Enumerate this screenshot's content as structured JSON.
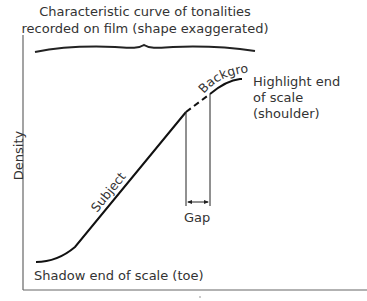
{
  "title": {
    "line1": "Characteristic curve of tonalities",
    "line2": "recorded on film (shape exaggerated)"
  },
  "axes": {
    "y_label": "Density",
    "x_label": ""
  },
  "labels": {
    "subject": "Subject",
    "background": "Background",
    "highlight_line1": "Highlight end",
    "highlight_line2": "of scale",
    "highlight_line3": "(shoulder)",
    "gap": "Gap",
    "shadow": "Shadow end of scale (toe)"
  },
  "colors": {
    "ink": "#222222",
    "axis": "#555555",
    "background": "#ffffff"
  }
}
